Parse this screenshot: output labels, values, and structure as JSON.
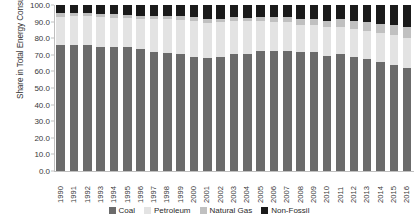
{
  "chart_data": {
    "type": "bar",
    "stacked": true,
    "title": "",
    "xlabel": "",
    "ylabel": "Share in Total Energy Consumption (%)",
    "ylim": [
      0,
      100
    ],
    "ytick_labels": [
      "100.0",
      "90.0",
      "80.0",
      "70.0",
      "60.0",
      "50.0",
      "40.0",
      "30.0",
      "20.0",
      "10.0",
      "0.0"
    ],
    "ytick_values": [
      100,
      90,
      80,
      70,
      60,
      50,
      40,
      30,
      20,
      10,
      0
    ],
    "grid": false,
    "legend_position": "bottom",
    "categories": [
      "1990",
      "1991",
      "1992",
      "1993",
      "1994",
      "1995",
      "1996",
      "1997",
      "1998",
      "1999",
      "2000",
      "2001",
      "2002",
      "2003",
      "2004",
      "2005",
      "2006",
      "2007",
      "2008",
      "2009",
      "2010",
      "2011",
      "2012",
      "2013",
      "2014",
      "2015",
      "2016"
    ],
    "series": [
      {
        "name": "Coal",
        "color": "#6b6b6b",
        "values": [
          76.2,
          76.1,
          75.7,
          74.7,
          75.0,
          74.6,
          73.5,
          71.4,
          70.9,
          70.6,
          68.5,
          68.0,
          68.5,
          70.2,
          70.2,
          72.4,
          72.4,
          72.5,
          71.5,
          71.6,
          69.2,
          70.2,
          68.5,
          67.4,
          65.6,
          63.7,
          62.0
        ]
      },
      {
        "name": "Petroleum",
        "color": "#e3e3e3",
        "values": [
          16.6,
          17.1,
          17.5,
          18.2,
          17.4,
          17.5,
          18.0,
          20.4,
          20.8,
          20.5,
          22.0,
          21.2,
          21.0,
          20.1,
          19.9,
          17.8,
          17.5,
          17.0,
          16.7,
          16.4,
          17.4,
          16.8,
          17.0,
          17.1,
          17.4,
          18.3,
          18.3
        ]
      },
      {
        "name": "Natural Gas",
        "color": "#c0c0c0",
        "values": [
          2.1,
          2.0,
          1.9,
          1.9,
          1.9,
          1.8,
          1.8,
          1.7,
          1.8,
          2.0,
          2.2,
          2.4,
          2.3,
          2.3,
          2.3,
          2.4,
          2.7,
          3.0,
          3.4,
          3.4,
          4.0,
          4.6,
          4.8,
          5.3,
          5.7,
          5.9,
          6.4
        ]
      },
      {
        "name": "Non-Fossil",
        "color": "#1a1a1a",
        "values": [
          5.1,
          4.8,
          4.9,
          5.2,
          5.7,
          6.1,
          6.7,
          6.5,
          6.5,
          6.9,
          7.3,
          8.4,
          8.2,
          7.4,
          7.6,
          7.4,
          7.4,
          7.5,
          8.4,
          8.6,
          9.4,
          8.4,
          9.7,
          10.2,
          11.3,
          12.1,
          13.3
        ]
      }
    ]
  },
  "legend": {
    "items": [
      {
        "label": "Coal",
        "color": "#6b6b6b"
      },
      {
        "label": "Petroleum",
        "color": "#e3e3e3"
      },
      {
        "label": "Natural Gas",
        "color": "#c0c0c0"
      },
      {
        "label": "Non-Fossil",
        "color": "#1a1a1a"
      }
    ]
  }
}
